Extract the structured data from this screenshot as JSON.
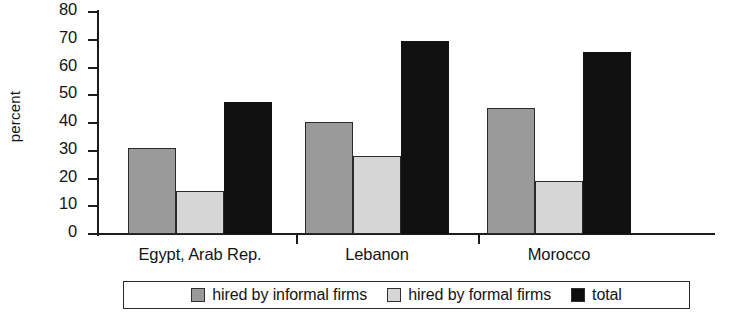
{
  "chart_data": {
    "type": "bar",
    "title": "",
    "xlabel": "",
    "ylabel": "percent",
    "ylim": [
      0,
      80
    ],
    "ytick_step": 10,
    "yticks": [
      80,
      70,
      60,
      50,
      40,
      30,
      20,
      10,
      0
    ],
    "grid": false,
    "legend_position": "bottom",
    "categories": [
      "Egypt, Arab Rep.",
      "Lebanon",
      "Morocco"
    ],
    "series": [
      {
        "name": "hired by informal firms",
        "color": "#9a9a9a",
        "values": [
          31,
          40.5,
          45.5
        ]
      },
      {
        "name": "hired by formal firms",
        "color": "#d6d6d6",
        "values": [
          15.5,
          28,
          19
        ]
      },
      {
        "name": "total",
        "color": "#111111",
        "values": [
          47.5,
          69.5,
          65.5
        ]
      }
    ]
  },
  "axis": {
    "y_label": "percent",
    "y_tick_labels": [
      "80",
      "70",
      "60",
      "50",
      "40",
      "30",
      "20",
      "10",
      "0"
    ]
  },
  "x_axis": {
    "labels": [
      "Egypt, Arab Rep.",
      "Lebanon",
      "Morocco"
    ]
  },
  "legend": {
    "items": [
      {
        "label": "hired by informal firms",
        "swatch": "informal"
      },
      {
        "label": "hired by formal firms",
        "swatch": "formal"
      },
      {
        "label": "total",
        "swatch": "total"
      }
    ]
  },
  "colors": {
    "informal": "#9a9a9a",
    "formal": "#d6d6d6",
    "total": "#111111",
    "axis": "#1c1c1c",
    "background": "#ffffff"
  }
}
